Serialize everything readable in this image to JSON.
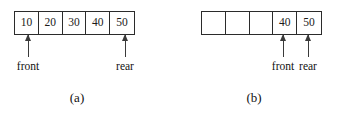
{
  "figure": {
    "panels": [
      {
        "id": "a",
        "caption": "(a)",
        "cells": [
          {
            "value": "10",
            "empty": false
          },
          {
            "value": "20",
            "empty": false
          },
          {
            "value": "30",
            "empty": false
          },
          {
            "value": "40",
            "empty": false
          },
          {
            "value": "50",
            "empty": false
          }
        ],
        "pointers": [
          {
            "label": "front",
            "cell_index": 0,
            "x": 28
          },
          {
            "label": "rear",
            "cell_index": 4,
            "x": 125
          }
        ]
      },
      {
        "id": "b",
        "caption": "(b)",
        "cells": [
          {
            "value": "",
            "empty": true
          },
          {
            "value": "",
            "empty": true
          },
          {
            "value": "",
            "empty": true
          },
          {
            "value": "40",
            "empty": false
          },
          {
            "value": "50",
            "empty": false
          }
        ],
        "pointers": [
          {
            "label": "front",
            "cell_index": 3,
            "x": 97
          },
          {
            "label": "rear",
            "cell_index": 4,
            "x": 122
          }
        ]
      }
    ]
  },
  "colors": {
    "stroke": "#2b2b2b",
    "arrow": "#3a3a3a",
    "text": "#111111",
    "background": "#ffffff"
  }
}
